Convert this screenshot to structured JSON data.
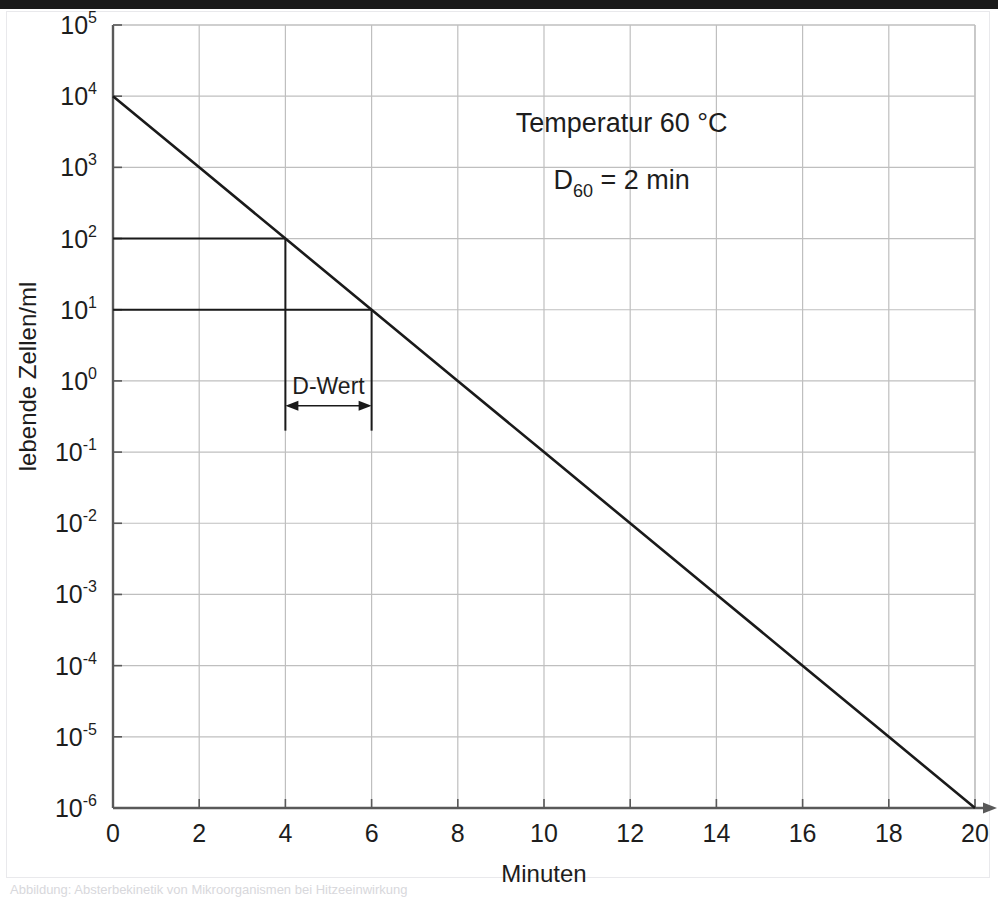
{
  "figure": {
    "background_color": "#ffffff",
    "frame_border_color": "#e9e9ec",
    "top_bar_color": "#1a1a1a"
  },
  "chart_data": {
    "type": "line",
    "title": "",
    "xlabel": "Minuten",
    "ylabel": "lebende Zellen/ml",
    "yscale": "log",
    "xlim": [
      0,
      20
    ],
    "ylim": [
      1e-06,
      100000.0
    ],
    "grid": true,
    "legend": null,
    "x_ticks": [
      0,
      2,
      4,
      6,
      8,
      10,
      12,
      14,
      16,
      18,
      20
    ],
    "x_tick_labels": [
      "0",
      "2",
      "4",
      "6",
      "8",
      "10",
      "12",
      "14",
      "16",
      "18",
      "20"
    ],
    "y_ticks": [
      100000,
      10000,
      1000,
      100,
      10,
      1,
      0.1,
      0.01,
      0.001,
      0.0001,
      1e-05,
      1e-06
    ],
    "y_tick_labels": [
      {
        "base": "10",
        "exp": "5"
      },
      {
        "base": "10",
        "exp": "4"
      },
      {
        "base": "10",
        "exp": "3"
      },
      {
        "base": "10",
        "exp": "2"
      },
      {
        "base": "10",
        "exp": "1"
      },
      {
        "base": "10",
        "exp": "0"
      },
      {
        "base": "10",
        "exp": "-1"
      },
      {
        "base": "10",
        "exp": "-2"
      },
      {
        "base": "10",
        "exp": "-3"
      },
      {
        "base": "10",
        "exp": "-4"
      },
      {
        "base": "10",
        "exp": "-5"
      },
      {
        "base": "10",
        "exp": "-6"
      }
    ],
    "series": [
      {
        "name": "Absterbekinetik",
        "color": "#1a1a1a",
        "x": [
          0,
          2,
          4,
          6,
          8,
          10,
          12,
          14,
          16,
          18,
          20
        ],
        "y": [
          10000,
          1000,
          100,
          10,
          1,
          0.1,
          0.01,
          0.001,
          0.0001,
          1e-05,
          1e-06
        ]
      }
    ],
    "annotations": [
      {
        "id": "temperature",
        "text": "Temperatur 60 °C",
        "x": 11.8,
        "y_decade": 3.5
      },
      {
        "id": "d-value-formula",
        "base": "D",
        "sub": "60",
        "rest": " = 2 min",
        "x": 11.8,
        "y_decade": 2.7
      },
      {
        "id": "d-wert-bracket",
        "text": "D-Wert",
        "x_from": 4,
        "x_to": 6
      }
    ],
    "construction_lines": [
      {
        "id": "h-line-1e2",
        "type": "horizontal",
        "y": 100,
        "x_from": 0,
        "x_to": 4
      },
      {
        "id": "v-line-x4",
        "type": "vertical",
        "x": 4,
        "y_from": 100,
        "y_to": 0.2
      },
      {
        "id": "h-line-1e1",
        "type": "horizontal",
        "y": 10,
        "x_from": 0,
        "x_to": 6
      },
      {
        "id": "v-line-x6",
        "type": "vertical",
        "x": 6,
        "y_from": 10,
        "y_to": 0.2
      }
    ]
  },
  "caption": {
    "text": "Abbildung: Absterbekinetik von Mikroorganismen bei Hitzeeinwirkung"
  }
}
